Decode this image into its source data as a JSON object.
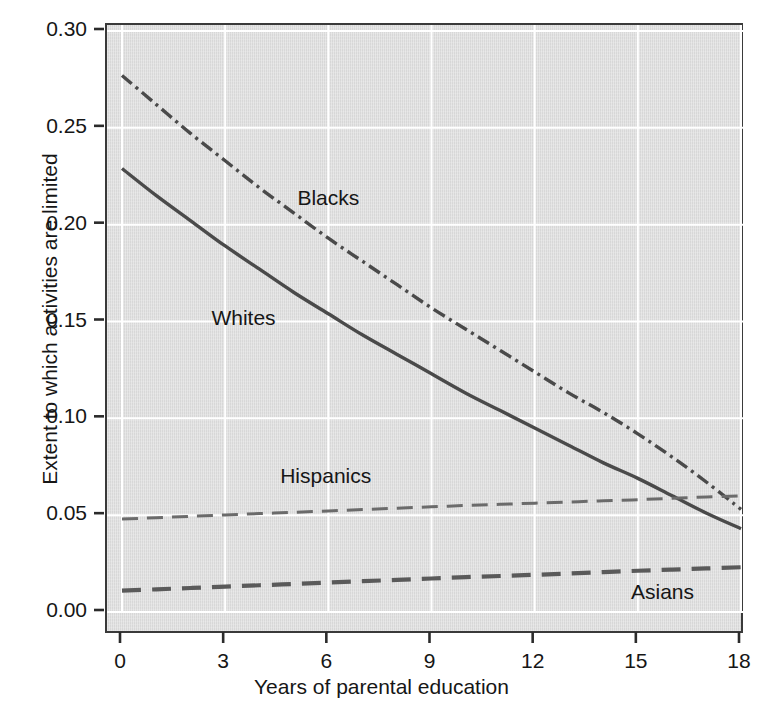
{
  "chart_data": {
    "type": "line",
    "title": "",
    "xlabel": "Years of parental education",
    "ylabel": "Extent to which activities are limited",
    "xlim": [
      0,
      18
    ],
    "ylim": [
      0.0,
      0.3
    ],
    "xticks": [
      "0",
      "3",
      "6",
      "9",
      "12",
      "15",
      "18"
    ],
    "xtick_values": [
      0,
      3,
      6,
      9,
      12,
      15,
      18
    ],
    "yticks": [
      "0.00",
      "0.05",
      "0.10",
      "0.15",
      "0.20",
      "0.25",
      "0.30"
    ],
    "ytick_values": [
      0.0,
      0.05,
      0.1,
      0.15,
      0.2,
      0.25,
      0.3
    ],
    "grid": true,
    "grid_color": "#ffffff",
    "panel_color": "#dcdcdc",
    "legend_position": "inline-annotations",
    "x": [
      0,
      1,
      2,
      3,
      4,
      5,
      6,
      7,
      8,
      9,
      10,
      11,
      12,
      13,
      14,
      15,
      16,
      17,
      18
    ],
    "series": [
      {
        "name": "Blacks",
        "style": "dash-dot",
        "color": "#4a4a4a",
        "label_x": 5.1,
        "label_y": 0.214,
        "values": [
          0.277,
          0.262,
          0.247,
          0.233,
          0.219,
          0.206,
          0.193,
          0.181,
          0.169,
          0.157,
          0.146,
          0.135,
          0.124,
          0.113,
          0.103,
          0.092,
          0.08,
          0.067,
          0.053
        ]
      },
      {
        "name": "Whites",
        "style": "solid",
        "color": "#4a4a4a",
        "label_x": 2.6,
        "label_y": 0.152,
        "values": [
          0.229,
          0.215,
          0.202,
          0.189,
          0.177,
          0.165,
          0.154,
          0.143,
          0.133,
          0.123,
          0.113,
          0.104,
          0.095,
          0.086,
          0.077,
          0.069,
          0.06,
          0.051,
          0.043
        ]
      },
      {
        "name": "Hispanics",
        "style": "dashed-thin",
        "color": "#6b6b6b",
        "label_x": 4.6,
        "label_y": 0.07,
        "values": [
          0.048,
          0.0487,
          0.0494,
          0.0501,
          0.0508,
          0.0515,
          0.0522,
          0.0529,
          0.0536,
          0.0543,
          0.055,
          0.0556,
          0.0562,
          0.0568,
          0.0574,
          0.058,
          0.0587,
          0.0594,
          0.06
        ]
      },
      {
        "name": "Asians",
        "style": "dashed-thick",
        "color": "#5a5a5a",
        "label_x": 14.8,
        "label_y": 0.0105,
        "values": [
          0.011,
          0.0117,
          0.0124,
          0.0131,
          0.0138,
          0.0145,
          0.0152,
          0.0159,
          0.0166,
          0.0173,
          0.018,
          0.0186,
          0.0192,
          0.0199,
          0.0206,
          0.0213,
          0.0219,
          0.0225,
          0.0231
        ]
      }
    ]
  }
}
